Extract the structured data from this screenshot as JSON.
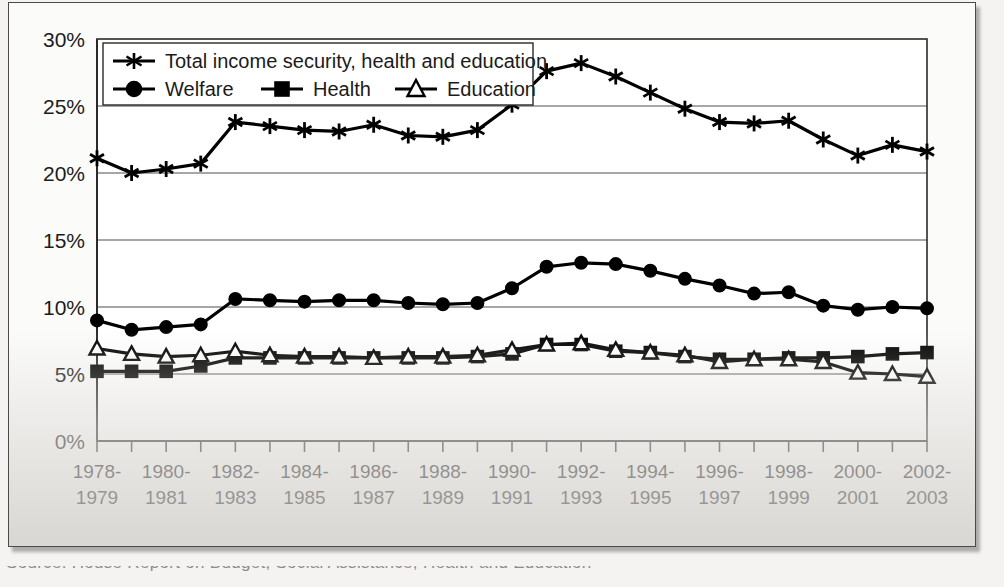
{
  "figure": {
    "background_color": "#fbfbfa",
    "frame_color": "#4a4a48",
    "caption_partial": "Source: House Report on Budget, Social Assistance, Health and Education"
  },
  "axes": {
    "y_ticks": [
      "0%",
      "5%",
      "10%",
      "15%",
      "20%",
      "25%",
      "30%"
    ],
    "x_ticks_top": [
      "1978-",
      "1980-",
      "1982-",
      "1984-",
      "1986-",
      "1988-",
      "1990-",
      "1992-",
      "1994-",
      "1996-",
      "1998-",
      "2000-",
      "2002-"
    ],
    "x_ticks_bottom": [
      "1979",
      "1981",
      "1983",
      "1985",
      "1987",
      "1989",
      "1991",
      "1993",
      "1995",
      "1997",
      "1999",
      "2001",
      "2003"
    ]
  },
  "legend": {
    "entries": [
      {
        "label": "Total income security, health and education",
        "marker": "asterisk-marker"
      },
      {
        "label": "Welfare",
        "marker": "circle-marker"
      },
      {
        "label": "Health",
        "marker": "square-marker"
      },
      {
        "label": "Education",
        "marker": "triangle-marker"
      }
    ]
  },
  "chart_data": {
    "type": "line",
    "title": "",
    "subtitle": "",
    "xlabel": "",
    "ylabel": "",
    "ylim": [
      0,
      30
    ],
    "y_tick_values": [
      0,
      5,
      10,
      15,
      20,
      25,
      30
    ],
    "grid": true,
    "legend_position": "top-left-inside",
    "categories": [
      "1978-1979",
      "1979-1980",
      "1980-1981",
      "1981-1982",
      "1982-1983",
      "1983-1984",
      "1984-1985",
      "1985-1986",
      "1986-1987",
      "1987-1988",
      "1988-1989",
      "1989-1990",
      "1990-1991",
      "1991-1992",
      "1992-1993",
      "1993-1994",
      "1994-1995",
      "1995-1996",
      "1996-1997",
      "1997-1998",
      "1998-1999",
      "1999-2000",
      "2000-2001",
      "2001-2002",
      "2002-2003"
    ],
    "series": [
      {
        "name": "Total income security, health and education",
        "marker": "asterisk",
        "values": [
          21.1,
          20.0,
          20.3,
          20.7,
          23.8,
          23.5,
          23.2,
          23.1,
          23.6,
          22.8,
          22.7,
          23.2,
          25.1,
          27.6,
          28.2,
          27.2,
          26.0,
          24.8,
          23.8,
          23.7,
          23.9,
          22.5,
          21.3,
          22.1,
          21.6
        ]
      },
      {
        "name": "Welfare",
        "marker": "circle",
        "values": [
          9.0,
          8.3,
          8.5,
          8.7,
          10.6,
          10.5,
          10.4,
          10.5,
          10.5,
          10.3,
          10.2,
          10.3,
          11.4,
          13.0,
          13.3,
          13.2,
          12.7,
          12.1,
          11.6,
          11.0,
          11.1,
          10.1,
          9.8,
          10.0,
          9.9
        ]
      },
      {
        "name": "Health",
        "marker": "square",
        "values": [
          5.2,
          5.2,
          5.2,
          5.6,
          6.2,
          6.2,
          6.2,
          6.2,
          6.2,
          6.2,
          6.2,
          6.3,
          6.5,
          7.2,
          7.2,
          6.7,
          6.6,
          6.3,
          6.1,
          6.1,
          6.2,
          6.2,
          6.3,
          6.5,
          6.6
        ]
      },
      {
        "name": "Education",
        "marker": "triangle",
        "values": [
          6.9,
          6.5,
          6.3,
          6.4,
          6.7,
          6.4,
          6.3,
          6.3,
          6.2,
          6.3,
          6.3,
          6.4,
          6.8,
          7.2,
          7.3,
          6.8,
          6.6,
          6.4,
          5.9,
          6.1,
          6.1,
          5.9,
          5.1,
          5.0,
          4.8
        ]
      }
    ]
  }
}
